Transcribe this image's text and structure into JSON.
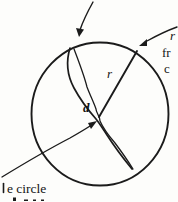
{
  "figure": {
    "colors": {
      "ink": "#1b1b1b",
      "paper": "#fdfdfb"
    },
    "labels": {
      "radius_label": "r",
      "width_label": "d",
      "edge_text_line1": "r",
      "edge_text_line2": "fr",
      "edge_text_line3": "c",
      "caption_fragment": "e circle"
    }
  }
}
